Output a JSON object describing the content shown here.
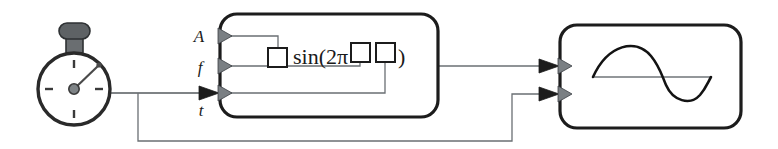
{
  "diagram": {
    "background_color": "#ffffff",
    "width": 778,
    "height": 149
  },
  "timer": {
    "name": "stopwatch",
    "icon": "stopwatch-icon",
    "label": "",
    "description": "Stopwatch timer source",
    "center_x": 74,
    "center_y": 89,
    "radius": 36,
    "hand_angle_deg": 45,
    "tick_count": 4,
    "body_color": "#2a2a2a",
    "crown_color": "#5e6265",
    "hub_color": "#7e8386"
  },
  "function_block": {
    "name": "sine-function-block",
    "x": 220,
    "y": 14,
    "width": 218,
    "height": 103,
    "border_color": "#1c1c1c",
    "fill_color": "#ffffff",
    "formula": {
      "prefix": "",
      "function_name": "sin",
      "open_paren": "(",
      "coefficient": "2",
      "pi_symbol": "π",
      "close_paren": ")",
      "full_text": "□ sin(2π□□)",
      "placeholder_count": 3,
      "placeholder_symbol": "□"
    },
    "inputs": [
      {
        "name": "input-amplitude",
        "label": "A",
        "y": 36,
        "terminal": "amplitude"
      },
      {
        "name": "input-frequency",
        "label": "f",
        "y": 66,
        "terminal": "frequency"
      },
      {
        "name": "input-time",
        "label": "t",
        "y": 93,
        "terminal": "time"
      }
    ],
    "outputs": [
      {
        "name": "output-signal",
        "label": "",
        "y": 66
      }
    ]
  },
  "display_block": {
    "name": "waveform-display-block",
    "x": 560,
    "y": 25,
    "width": 181,
    "height": 103,
    "border_color": "#1c1c1c",
    "fill_color": "#ffffff",
    "graph": {
      "name": "sine-wave-graph",
      "curve_color": "#131313",
      "axis_color": "#6f7478",
      "cycles": 1
    },
    "inputs": [
      {
        "name": "display-input-signal",
        "label": "",
        "y": 66,
        "terminal": "signal"
      },
      {
        "name": "display-input-time",
        "label": "",
        "y": 94,
        "terminal": "time"
      }
    ]
  },
  "wires": [
    {
      "name": "wire-timer-to-time-input",
      "from": "stopwatch",
      "to": "input-time"
    },
    {
      "name": "wire-timer-branch-to-display",
      "from": "stopwatch",
      "to": "display-input-time"
    },
    {
      "name": "wire-function-output-to-display",
      "from": "output-signal",
      "to": "display-input-signal"
    },
    {
      "name": "wire-amplitude-internal",
      "from": "input-amplitude",
      "to": "formula-placeholder-1"
    },
    {
      "name": "wire-frequency-internal",
      "from": "input-frequency",
      "to": "formula-placeholder-2"
    },
    {
      "name": "wire-time-internal",
      "from": "input-time",
      "to": "formula-placeholder-3"
    }
  ],
  "colors": {
    "wire": "#555a5e",
    "arrow_fill": "#7a7f83",
    "block_border": "#1c1c1c",
    "text": "#1a1a1a"
  }
}
